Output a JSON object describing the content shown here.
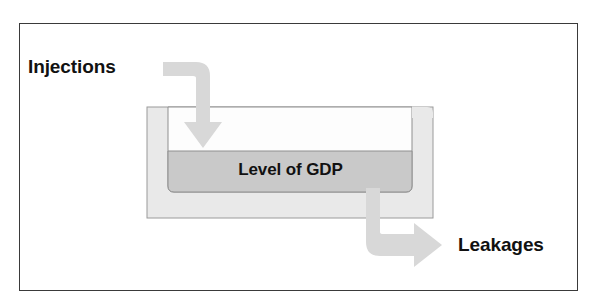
{
  "diagram": {
    "frame": {
      "border_color": "#3a3a3a",
      "background": "#ffffff"
    },
    "labels": {
      "injections": "Injections",
      "leakages": "Leakages",
      "gdp_level": "Level of GDP"
    },
    "container": {
      "name": "gdp-tub",
      "wall_color": "#e9e9e9",
      "wall_outline": "#9a9a9a",
      "cavity_color": "#fdfdfd",
      "fill_color": "#c9c9c9",
      "fill_outline": "#8f8f8f"
    },
    "arrows": {
      "injection": {
        "name": "injection-arrow",
        "direction": "down",
        "color": "#d8d8d8"
      },
      "leakage": {
        "name": "leakage-arrow",
        "direction": "right",
        "color": "#d8d8d8"
      }
    }
  }
}
